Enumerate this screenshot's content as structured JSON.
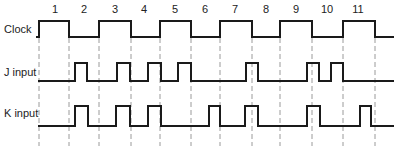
{
  "diagram": {
    "period_labels": [
      "1",
      "2",
      "3",
      "4",
      "5",
      "6",
      "7",
      "8",
      "9",
      "10",
      "11"
    ],
    "period_label_x": [
      55,
      84,
      115,
      144,
      175,
      205,
      235,
      266,
      296,
      327,
      358
    ],
    "edge_x": [
      39,
      69,
      99,
      131,
      160,
      191,
      220,
      252,
      280,
      312,
      343,
      375
    ],
    "signals": [
      {
        "name": "Clock",
        "label_y": 23,
        "high_y": 21,
        "low_y": 37,
        "start_x": 36,
        "end_x": 394,
        "initial": "low",
        "transitions": [
          39,
          69,
          99,
          131,
          160,
          191,
          220,
          252,
          280,
          312,
          343,
          375
        ]
      },
      {
        "name": "J input",
        "label_y": 66,
        "high_y": 63,
        "low_y": 81,
        "start_x": 38,
        "end_x": 394,
        "pulses": [
          [
            75,
            87
          ],
          [
            117,
            130
          ],
          [
            148,
            161
          ],
          [
            178,
            191
          ],
          [
            246,
            258
          ],
          [
            307,
            319
          ],
          [
            331,
            343
          ]
        ]
      },
      {
        "name": "K input",
        "label_y": 107,
        "high_y": 106,
        "low_y": 126,
        "start_x": 38,
        "end_x": 394,
        "pulses": [
          [
            75,
            88
          ],
          [
            116,
            130
          ],
          [
            148,
            161
          ],
          [
            209,
            220
          ],
          [
            245,
            258
          ],
          [
            307,
            320
          ],
          [
            360,
            371
          ]
        ]
      }
    ],
    "dashed_line": {
      "top": 38,
      "bottom": 146,
      "color": "#9a9a9a"
    },
    "line_color": "#1a1a1a"
  }
}
